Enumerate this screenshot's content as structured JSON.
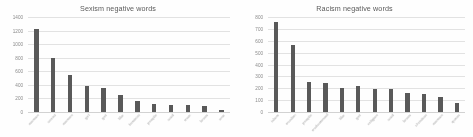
{
  "chart_data": [
    {
      "type": "bar",
      "title": "Sexism negative words",
      "xlabel": "",
      "ylabel": "",
      "ylim": [
        0,
        1400
      ],
      "yticks": [
        0,
        200,
        400,
        600,
        800,
        1000,
        1200,
        1400
      ],
      "grid": true,
      "legend": false,
      "bar_color": "#595959",
      "categories": [
        "woman",
        "sexist",
        "women",
        "girl",
        "get",
        "like",
        "feminist",
        "people",
        "said",
        "man",
        "know",
        "one"
      ],
      "values": [
        1230,
        790,
        540,
        390,
        350,
        250,
        165,
        115,
        110,
        100,
        95,
        25
      ]
    },
    {
      "type": "bar",
      "title": "Racism negative words",
      "xlabel": "",
      "ylabel": "",
      "ylim": [
        0,
        800
      ],
      "yticks": [
        0,
        100,
        200,
        300,
        400,
        500,
        600,
        700,
        800
      ],
      "grid": true,
      "legend": false,
      "bar_color": "#595959",
      "categories": [
        "islam",
        "muslim",
        "people",
        "mohammed",
        "like",
        "get",
        "religion",
        "said",
        "know",
        "christian",
        "woman",
        "quran"
      ],
      "values": [
        755,
        565,
        255,
        245,
        205,
        215,
        195,
        190,
        160,
        155,
        130,
        75
      ]
    }
  ],
  "colors": {
    "bar": "#595959",
    "gridline": "#e2e2e2",
    "tick_text": "#8a8a8a",
    "title_text": "#5a5a5a",
    "background": "#ffffff"
  }
}
